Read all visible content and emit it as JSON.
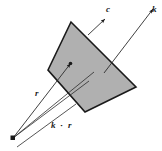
{
  "figure": {
    "background_color": "#ffffff",
    "plane": {
      "name": "wavefront-plane",
      "fill_color": "#b0b0b0",
      "stroke_color": "#1a1a1a",
      "vertices": "71,22 48,70 85,112 136,87"
    },
    "labels": {
      "c": "c",
      "k": "k",
      "r": "r",
      "k_dot_r_vector_k": "k",
      "k_dot_r_operator": "·",
      "k_dot_r_vector_r": "r"
    },
    "rays": {
      "c_arrow": "velocity-vector-c",
      "k_arrow": "wave-vector-k",
      "r_arrow": "position-vector-r",
      "projection_line": "k-dot-r-projection-line",
      "origin_point": "origin-point"
    },
    "colors": {
      "line": "#2b2b2b",
      "fill": "#b0b0b0",
      "text": "#1a1a1a"
    }
  }
}
